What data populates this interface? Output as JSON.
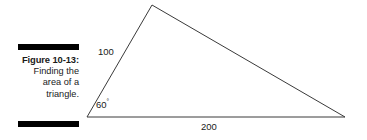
{
  "figure": {
    "caption_title": "Figure 10-13:",
    "caption_lines": [
      "Finding the",
      "area of a",
      "triangle."
    ],
    "rule_color": "#000000",
    "text_color": "#1a1a1a",
    "background": "#ffffff"
  },
  "diagram": {
    "type": "triangle",
    "stroke_color": "#3a3a3a",
    "stroke_width": 1,
    "vertices": {
      "left": {
        "x": 87,
        "y": 117
      },
      "apex": {
        "x": 152,
        "y": 5
      },
      "right": {
        "x": 345,
        "y": 117
      }
    },
    "labels": {
      "side_left": "100",
      "base": "200",
      "angle": "60",
      "angle_unit": "°"
    }
  }
}
